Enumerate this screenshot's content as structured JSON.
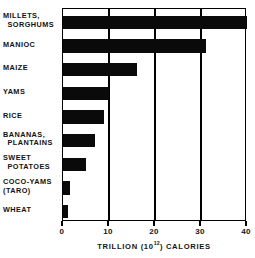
{
  "chart_data": {
    "type": "bar",
    "orientation": "horizontal",
    "title": "",
    "xlabel": "TRILLION (10¹²) CALORIES",
    "xlabel_main": "TRILLION (10",
    "xlabel_sup": "12",
    "xlabel_tail": ") CALORIES",
    "ylabel": "",
    "categories": [
      "MILLETS, SORGHUMS",
      "MANIOC",
      "MAIZE",
      "YAMS",
      "RICE",
      "BANANAS, PLANTAINS",
      "SWEET POTATOES",
      "COCO-YAMS (TARO)",
      "WHEAT"
    ],
    "category_lines": [
      [
        "MILLETS,",
        "SORGHUMS"
      ],
      [
        "MANIOC",
        ""
      ],
      [
        "MAIZE",
        ""
      ],
      [
        "YAMS",
        ""
      ],
      [
        "RICE",
        ""
      ],
      [
        "BANANAS,",
        "PLANTAINS"
      ],
      [
        "SWEET",
        "POTATOES"
      ],
      [
        "COCO-YAMS",
        "(TARO)"
      ],
      [
        "WHEAT",
        ""
      ]
    ],
    "values": [
      40,
      31,
      16,
      10,
      9,
      7,
      5,
      1.5,
      1
    ],
    "units": "trillion (10^12) calories",
    "xlim": [
      0,
      40
    ],
    "xticks": [
      0,
      10,
      20,
      30,
      40
    ],
    "xtick_labels": [
      "0",
      "10",
      "20",
      "30",
      "40"
    ],
    "gridlines": [
      10,
      20,
      30
    ],
    "grid": true,
    "legend": "none",
    "bar_color": "#0a0a0a",
    "frame_color": "#000000",
    "background": "#ffffff"
  }
}
